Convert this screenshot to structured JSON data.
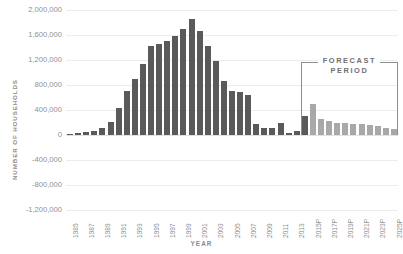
{
  "chart_data": {
    "type": "bar",
    "title": "",
    "xlabel": "YEAR",
    "ylabel": "NUMBER OF HOUSEHOLDS",
    "ylim": [
      -1200000,
      2000000
    ],
    "ytick_labels": [
      "2,000,000",
      "1,600,000",
      "1,200,000",
      "800,000",
      "400,000",
      "0",
      "-400,000",
      "-800,000",
      "-1,200,000"
    ],
    "ytick_values": [
      2000000,
      1600000,
      1200000,
      800000,
      400000,
      0,
      -400000,
      -800000,
      -1200000
    ],
    "grid": true,
    "legend_position": "none",
    "annotations": [
      {
        "text": "FORECAST PERIOD",
        "line1": "FORECAST",
        "line2": "PERIOD",
        "start_category": "2014P",
        "end_category": "2025P"
      }
    ],
    "colors": {
      "historical_bar": "#5a5a5a",
      "forecast_bar": "#a8a8a8",
      "gridline": "#ececec",
      "zero_line": "#e2e2e2",
      "axis_text": "#909090",
      "annotation": "#6f6f6f"
    },
    "categories": [
      "1985",
      "1986",
      "1987",
      "1988",
      "1989",
      "1990",
      "1991",
      "1992",
      "1993",
      "1994",
      "1995",
      "1996",
      "1997",
      "1998",
      "1999",
      "2000",
      "2001",
      "2002",
      "2003",
      "2004",
      "2005",
      "2006",
      "2007",
      "2008",
      "2009",
      "2010",
      "2011",
      "2012",
      "2013",
      "2014P",
      "2015P",
      "2016P",
      "2017P",
      "2018P",
      "2019P",
      "2020P",
      "2021P",
      "2022P",
      "2023P",
      "2024P",
      "2025P"
    ],
    "xtick_labels": [
      "1985",
      "1987",
      "1989",
      "1991",
      "1993",
      "1995",
      "1997",
      "1999",
      "2001",
      "2003",
      "2005",
      "2007",
      "2009",
      "2011",
      "2013",
      "2015P",
      "2017P",
      "2019P",
      "2021P",
      "2023P",
      "2025P"
    ],
    "xtick_indices": [
      0,
      2,
      4,
      6,
      8,
      10,
      12,
      14,
      16,
      18,
      20,
      22,
      24,
      26,
      28,
      30,
      32,
      34,
      36,
      38,
      40
    ],
    "values": [
      20000,
      30000,
      45000,
      60000,
      110000,
      210000,
      430000,
      700000,
      900000,
      1130000,
      1420000,
      1450000,
      1500000,
      1590000,
      1700000,
      1850000,
      1670000,
      1430000,
      1190000,
      870000,
      700000,
      690000,
      640000,
      180000,
      120000,
      110000,
      190000,
      30000,
      60000,
      310000,
      490000,
      250000,
      220000,
      200000,
      185000,
      175000,
      170000,
      160000,
      150000,
      110000,
      100000
    ],
    "series_kind": [
      "historical",
      "historical",
      "historical",
      "historical",
      "historical",
      "historical",
      "historical",
      "historical",
      "historical",
      "historical",
      "historical",
      "historical",
      "historical",
      "historical",
      "historical",
      "historical",
      "historical",
      "historical",
      "historical",
      "historical",
      "historical",
      "historical",
      "historical",
      "historical",
      "historical",
      "historical",
      "historical",
      "historical",
      "historical",
      "historical",
      "forecast",
      "forecast",
      "forecast",
      "forecast",
      "forecast",
      "forecast",
      "forecast",
      "forecast",
      "forecast",
      "forecast",
      "forecast"
    ]
  }
}
